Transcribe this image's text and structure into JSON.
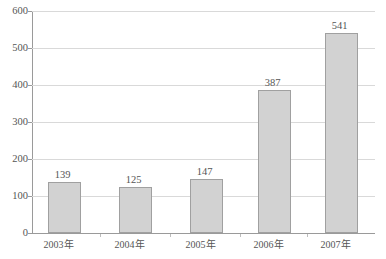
{
  "chart_data": {
    "type": "bar",
    "title": "",
    "subtitle": "",
    "xlabel": "",
    "ylabel": "",
    "categories": [
      "2003年",
      "2004年",
      "2005年",
      "2006年",
      "2007年"
    ],
    "values": [
      139,
      125,
      147,
      387,
      541
    ],
    "data_labels": [
      "139",
      "125",
      "147",
      "387",
      "541"
    ],
    "ylim": [
      0,
      600
    ],
    "y_ticks": [
      0,
      100,
      200,
      300,
      400,
      500,
      600
    ],
    "y_tick_labels": [
      "0",
      "100",
      "200",
      "300",
      "400",
      "500",
      "600"
    ],
    "grid": {
      "horizontal": true,
      "vertical": false
    },
    "legend": {
      "visible": false,
      "position": "none"
    },
    "series": [
      {
        "name": "",
        "values": [
          139,
          125,
          147,
          387,
          541
        ]
      }
    ],
    "colors": {
      "bar_fill": "#d2d2d2",
      "bar_stroke": "#a0a0a0",
      "grid": "#d9d9d9",
      "axis": "#9a9a9a",
      "text": "#555555",
      "background": "#ffffff"
    }
  }
}
